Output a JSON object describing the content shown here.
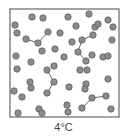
{
  "caption": "4°C",
  "colors": {
    "molecule_fill": "#8c8c8c",
    "molecule_stroke": "#555555",
    "box_stroke": "#666666",
    "bond": "#555555",
    "box_fill": "#ffffff"
  },
  "box": {
    "x": 10,
    "y": 9,
    "w": 109,
    "h": 108
  },
  "molecule_radius": 3.2,
  "molecules": [
    [
      32,
      17
    ],
    [
      43,
      18
    ],
    [
      68,
      17
    ],
    [
      89,
      14
    ],
    [
      15,
      25
    ],
    [
      76,
      26
    ],
    [
      95,
      27
    ],
    [
      98,
      24
    ],
    [
      108,
      20
    ],
    [
      113,
      27
    ],
    [
      17,
      33
    ],
    [
      48,
      32
    ],
    [
      60,
      33
    ],
    [
      26,
      39
    ],
    [
      38,
      43
    ],
    [
      93,
      35
    ],
    [
      82,
      40
    ],
    [
      72,
      42
    ],
    [
      112,
      40
    ],
    [
      55,
      49
    ],
    [
      42,
      51
    ],
    [
      78,
      52
    ],
    [
      92,
      55
    ],
    [
      16,
      56
    ],
    [
      64,
      57
    ],
    [
      86,
      61
    ],
    [
      103,
      57
    ],
    [
      108,
      56
    ],
    [
      31,
      62
    ],
    [
      17,
      69
    ],
    [
      47,
      70
    ],
    [
      54,
      66
    ],
    [
      80,
      70
    ],
    [
      87,
      70
    ],
    [
      54,
      82
    ],
    [
      30,
      82
    ],
    [
      31,
      88
    ],
    [
      69,
      87
    ],
    [
      86,
      84
    ],
    [
      85,
      89
    ],
    [
      108,
      79
    ],
    [
      14,
      91
    ],
    [
      22,
      97
    ],
    [
      47,
      93
    ],
    [
      92,
      98
    ],
    [
      106,
      96
    ],
    [
      82,
      108
    ],
    [
      67,
      105
    ],
    [
      68,
      112
    ],
    [
      39,
      109
    ],
    [
      42,
      113
    ],
    [
      18,
      113
    ],
    [
      111,
      109
    ]
  ],
  "bonds": [
    [
      [
        26,
        39
      ],
      [
        38,
        43
      ]
    ],
    [
      [
        38,
        43
      ],
      [
        48,
        32
      ]
    ],
    [
      [
        82,
        40
      ],
      [
        93,
        35
      ]
    ],
    [
      [
        78,
        52
      ],
      [
        82,
        40
      ]
    ],
    [
      [
        78,
        52
      ],
      [
        86,
        61
      ]
    ],
    [
      [
        47,
        70
      ],
      [
        54,
        82
      ]
    ],
    [
      [
        54,
        82
      ],
      [
        47,
        93
      ]
    ],
    [
      [
        92,
        98
      ],
      [
        106,
        96
      ]
    ],
    [
      [
        92,
        98
      ],
      [
        82,
        108
      ]
    ]
  ]
}
